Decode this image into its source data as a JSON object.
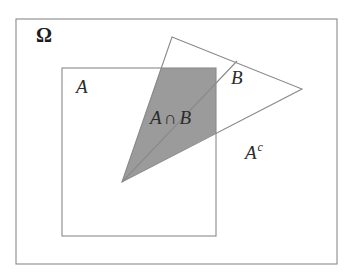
{
  "figure": {
    "background_color": "#ffffff",
    "stroke_color": "#7a7a7a",
    "shade_color": "#9b9b9b",
    "text_color": "#2b2b2b",
    "canvas": {
      "width": 360,
      "height": 278
    }
  },
  "labels": {
    "omega": "Ω",
    "set_a": "A",
    "set_b": "B",
    "intersection_a": "A",
    "intersection_symbol": "∩",
    "intersection_b": "B",
    "complement_base": "A",
    "complement_exponent": "c"
  },
  "shapes": {
    "universe_rect": {
      "name": "Omega",
      "x": 16,
      "y": 19,
      "width": 321,
      "height": 245
    },
    "set_a_rect": {
      "name": "A",
      "x": 62,
      "y": 68,
      "width": 154,
      "height": 168
    },
    "set_b_triangle": {
      "name": "B",
      "points": "172,37 302,89 122,182"
    },
    "intersection_polygon": {
      "name": "A ∩ B",
      "points": "122,182 161,68 216,68 216,133",
      "fill": "#9b9b9b"
    }
  }
}
